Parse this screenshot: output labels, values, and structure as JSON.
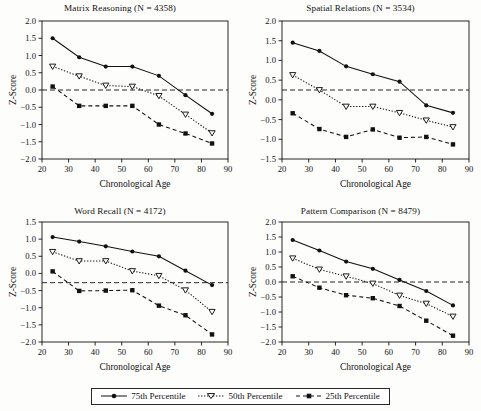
{
  "figure": {
    "xlabel": "Chronological Age",
    "ylabel": "Z-Score"
  },
  "legend": {
    "items": [
      {
        "label": "75th Percentile",
        "marker": "filled-circle-marker",
        "line": "solid"
      },
      {
        "label": "50th Percentile",
        "marker": "open-triangle-down-marker",
        "line": "dotted"
      },
      {
        "label": "25th Percentile",
        "marker": "filled-square-marker",
        "line": "dashed"
      }
    ]
  },
  "chart_data": [
    {
      "type": "line",
      "title": "Matrix Reasoning (N = 4358)",
      "xlabel": "Chronological Age",
      "ylabel": "Z-Score",
      "x": [
        24,
        34,
        44,
        54,
        64,
        74,
        84
      ],
      "xlim": [
        20,
        90
      ],
      "xticks": [
        20,
        30,
        40,
        50,
        60,
        70,
        80,
        90
      ],
      "ylim": [
        -2.0,
        2.0
      ],
      "yticks": [
        -2.0,
        -1.5,
        -1.0,
        -0.5,
        0.0,
        0.5,
        1.0,
        1.5,
        2.0
      ],
      "ytick_labels": [
        "-2.0",
        "-1.5",
        "-1.0",
        "-0.5",
        "0.0",
        "0.5",
        "1.0",
        "1.5",
        "2.0"
      ],
      "reference_line": 0.0,
      "grid": false,
      "legend_position": "below-figure",
      "series": [
        {
          "name": "75th Percentile",
          "values": [
            1.5,
            0.95,
            0.68,
            0.68,
            0.41,
            -0.15,
            -0.69
          ]
        },
        {
          "name": "50th Percentile",
          "values": [
            0.68,
            0.4,
            0.13,
            0.1,
            -0.17,
            -0.71,
            -1.25
          ]
        },
        {
          "name": "25th Percentile",
          "values": [
            0.1,
            -0.46,
            -0.46,
            -0.46,
            -1.0,
            -1.26,
            -1.55
          ]
        }
      ]
    },
    {
      "type": "line",
      "title": "Spatial Relations (N = 3534)",
      "xlabel": "Chronological Age",
      "ylabel": "Z-Score",
      "x": [
        24,
        34,
        44,
        54,
        64,
        74,
        84
      ],
      "xlim": [
        20,
        90
      ],
      "xticks": [
        20,
        30,
        40,
        50,
        60,
        70,
        80,
        90
      ],
      "ylim": [
        -1.5,
        2.0
      ],
      "yticks": [
        -1.5,
        -1.0,
        -0.5,
        0.0,
        0.5,
        1.0,
        1.5,
        2.0
      ],
      "ytick_labels": [
        "-1.5",
        "-1.0",
        "-0.5",
        "0.0",
        "0.5",
        "1.0",
        "1.5",
        "2.0"
      ],
      "reference_line": 0.25,
      "grid": false,
      "legend_position": "below-figure",
      "series": [
        {
          "name": "75th Percentile",
          "values": [
            1.45,
            1.24,
            0.85,
            0.65,
            0.46,
            -0.14,
            -0.33
          ]
        },
        {
          "name": "50th Percentile",
          "values": [
            0.63,
            0.25,
            -0.17,
            -0.17,
            -0.33,
            -0.52,
            -0.69
          ]
        },
        {
          "name": "25th Percentile",
          "values": [
            -0.34,
            -0.74,
            -0.94,
            -0.75,
            -0.96,
            -0.94,
            -1.13
          ]
        }
      ]
    },
    {
      "type": "line",
      "title": "Word Recall (N = 4172)",
      "xlabel": "Chronological Age",
      "ylabel": "Z-Score",
      "x": [
        24,
        34,
        44,
        54,
        64,
        74,
        84
      ],
      "xlim": [
        20,
        90
      ],
      "xticks": [
        20,
        30,
        40,
        50,
        60,
        70,
        80,
        90
      ],
      "ylim": [
        -2.0,
        1.5
      ],
      "yticks": [
        -2.0,
        -1.5,
        -1.0,
        -0.5,
        0.0,
        0.5,
        1.0,
        1.5
      ],
      "ytick_labels": [
        "-2.0",
        "-1.5",
        "-1.0",
        "-0.5",
        "0.0",
        "0.5",
        "1.0",
        "1.5"
      ],
      "reference_line": -0.27,
      "grid": false,
      "legend_position": "below-figure",
      "series": [
        {
          "name": "75th Percentile",
          "values": [
            1.06,
            0.93,
            0.79,
            0.64,
            0.5,
            0.08,
            -0.34
          ]
        },
        {
          "name": "50th Percentile",
          "values": [
            0.63,
            0.36,
            0.36,
            0.07,
            -0.07,
            -0.49,
            -1.12
          ]
        },
        {
          "name": "25th Percentile",
          "values": [
            0.06,
            -0.51,
            -0.5,
            -0.49,
            -0.94,
            -1.22,
            -1.78
          ]
        }
      ]
    },
    {
      "type": "line",
      "title": "Pattern Comparison (N = 8479)",
      "xlabel": "Chronological Age",
      "ylabel": "Z-Score",
      "x": [
        24,
        34,
        44,
        54,
        64,
        74,
        84
      ],
      "xlim": [
        20,
        90
      ],
      "xticks": [
        20,
        30,
        40,
        50,
        60,
        70,
        80,
        90
      ],
      "ylim": [
        -2.0,
        2.0
      ],
      "yticks": [
        -2.0,
        -1.5,
        -1.0,
        -0.5,
        0.0,
        0.5,
        1.0,
        1.5,
        2.0
      ],
      "ytick_labels": [
        "-2.0",
        "-1.5",
        "-1.0",
        "-0.5",
        "0.0",
        "0.5",
        "1.0",
        "1.5",
        "2.0"
      ],
      "reference_line": 0.0,
      "grid": false,
      "legend_position": "below-figure",
      "series": [
        {
          "name": "75th Percentile",
          "values": [
            1.4,
            1.05,
            0.68,
            0.44,
            0.07,
            -0.3,
            -0.78
          ]
        },
        {
          "name": "50th Percentile",
          "values": [
            0.79,
            0.42,
            0.19,
            -0.05,
            -0.45,
            -0.72,
            -1.15
          ]
        },
        {
          "name": "25th Percentile",
          "values": [
            0.19,
            -0.19,
            -0.44,
            -0.54,
            -0.8,
            -1.29,
            -1.79
          ]
        }
      ]
    }
  ]
}
